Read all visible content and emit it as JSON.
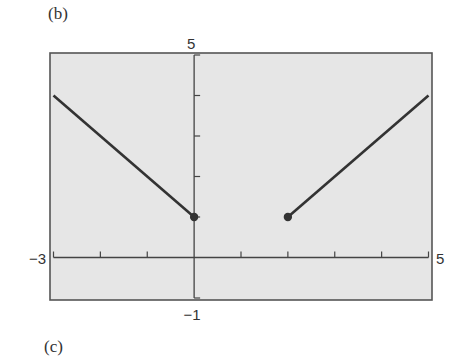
{
  "panels": {
    "top_label": "(b)",
    "bottom_label": "(c)"
  },
  "colors": {
    "plot_background": "#e6e6e6",
    "frame": "#555555",
    "axis": "#444444",
    "line": "#333333",
    "point": "#333333"
  },
  "chart_data": {
    "type": "line",
    "title": "",
    "xlabel": "",
    "ylabel": "",
    "xlim": [
      -3,
      5
    ],
    "ylim": [
      -1,
      5
    ],
    "xticks": [
      -3,
      -2,
      -1,
      0,
      1,
      2,
      3,
      4,
      5
    ],
    "yticks": [
      -1,
      0,
      1,
      2,
      3,
      4,
      5
    ],
    "tick_labels": {
      "xmin": "−3",
      "xmax": "5",
      "ymin": "−1",
      "ymax": "5"
    },
    "grid": false,
    "series": [
      {
        "name": "left-branch",
        "points": [
          [
            -3,
            4
          ],
          [
            0,
            1
          ]
        ],
        "endpoint_dot": [
          0,
          1
        ]
      },
      {
        "name": "right-branch",
        "points": [
          [
            2,
            1
          ],
          [
            5,
            4
          ]
        ],
        "endpoint_dot": [
          2,
          1
        ]
      }
    ]
  }
}
